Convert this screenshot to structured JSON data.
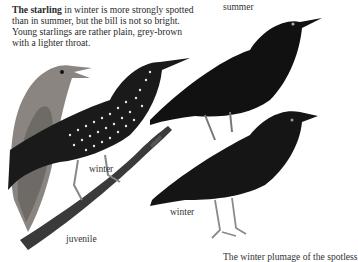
{
  "caption": {
    "bold_lead": "The starling",
    "text": " in winter is more strongly spotted than in summer, but the bill is not so bright. Young starlings are rather plain, grey-brown with a lighter throat."
  },
  "labels": {
    "summer": "summer",
    "winter_left": "winter",
    "winter_right": "winter",
    "juvenile": "juvenile"
  },
  "footer_text": "The winter plumage of the spotless",
  "illustrations": [
    {
      "name": "juvenile-starling",
      "description": "grey-brown juvenile starling with open bill, perched on branch"
    },
    {
      "name": "winter-starling-left",
      "description": "heavily spotted winter starling on branch"
    },
    {
      "name": "summer-starling",
      "description": "glossy dark summer starling"
    },
    {
      "name": "winter-starling-right",
      "description": "dark winter starling standing"
    }
  ],
  "colors": {
    "background": "#ffffff",
    "text": "#2a2a2a",
    "bird_dark": "#111111",
    "juvenile": "#8a8580"
  }
}
